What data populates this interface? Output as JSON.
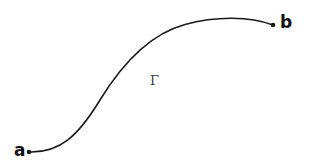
{
  "figure": {
    "type": "geometric-diagram",
    "background_color": "#ffffff",
    "stroke_color": "#1a1a1a",
    "stroke_width": 1.6,
    "width": 309,
    "height": 166
  },
  "curve": {
    "name": "curve-gamma",
    "label": "Γ",
    "label_x": 150,
    "label_y": 74,
    "path": "M 29 152 C 60 153, 78 136, 100 100 C 122 64, 150 34, 185 24.5 C 215 16, 250 16, 273 25",
    "start_point": {
      "label": "a",
      "x": 29,
      "y": 152
    },
    "end_point": {
      "label": "b",
      "x": 273,
      "y": 25
    }
  },
  "endpoints": [
    {
      "id": "point-a",
      "label": "a",
      "x": 29,
      "y": 152,
      "dot_radius": 2.3,
      "label_x": 14,
      "label_y": 142
    },
    {
      "id": "point-b",
      "label": "b",
      "x": 273,
      "y": 25,
      "dot_radius": 2.3,
      "label_x": 280,
      "label_y": 14
    }
  ]
}
